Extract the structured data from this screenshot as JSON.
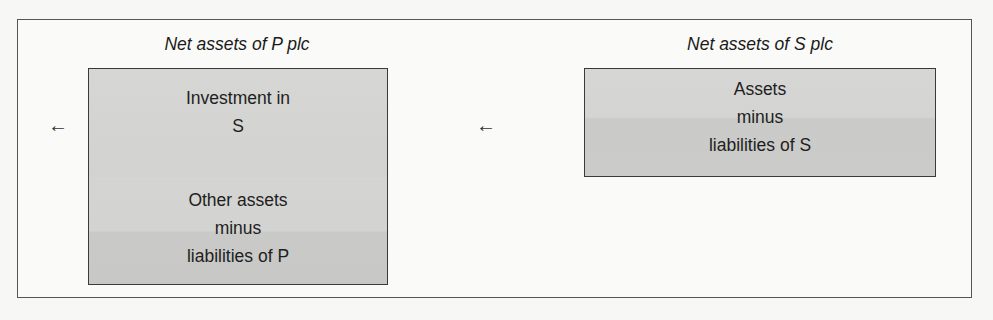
{
  "diagram": {
    "parent": {
      "title": "Net assets of P plc",
      "sections": [
        {
          "label": "Investment in\nS"
        },
        {
          "label": "Other assets\nminus\nliabilities of P"
        }
      ],
      "arrow": "←"
    },
    "subsidiary": {
      "title": "Net assets of S plc",
      "sections": [
        {
          "label": "Assets\nminus\nliabilities of S"
        }
      ],
      "arrow": "←"
    },
    "colors": {
      "box_fill": "#d3d3d1",
      "border": "#3a3a3a",
      "background": "#f7f7f5"
    }
  }
}
